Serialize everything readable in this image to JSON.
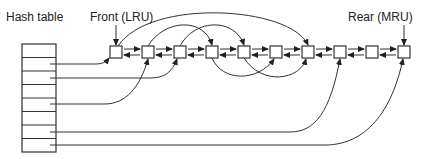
{
  "labels": {
    "hash_table": "Hash table",
    "front": "Front (LRU)",
    "rear": "Rear (MRU)"
  },
  "hash_table": {
    "rows": 8,
    "linked_rows": [
      1,
      2,
      4,
      6,
      7
    ]
  },
  "list": {
    "node_count": 10,
    "links": "doubly-linked (next and prev arrows between adjacent nodes)"
  },
  "colors": {
    "stroke": "#333333",
    "background": "#ffffff"
  }
}
